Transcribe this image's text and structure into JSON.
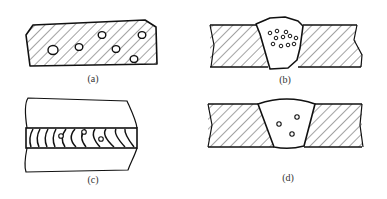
{
  "figure": {
    "panels": [
      {
        "id": "a",
        "label": "(a)",
        "description": "hatched base metal section with scattered pores"
      },
      {
        "id": "b",
        "label": "(b)",
        "description": "weld cross-section with clustered pores in weld bead"
      },
      {
        "id": "c",
        "label": "(c)",
        "description": "top view of weld bead with ripples and pores"
      },
      {
        "id": "d",
        "label": "(d)",
        "description": "weld cross-section with few scattered pores"
      }
    ],
    "colors": {
      "line": "#1a1a1a",
      "hatch": "#333333",
      "background": "#ffffff",
      "label": "#333333"
    }
  }
}
